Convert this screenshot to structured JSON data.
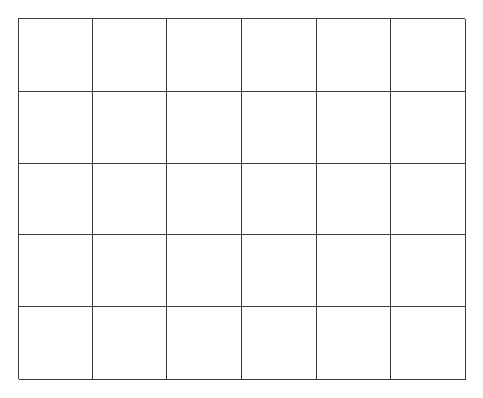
{
  "grid": {
    "columns": 6,
    "rows": 5,
    "line_color": "#3a3a3a",
    "background": "#ffffff",
    "cells": [
      [
        "",
        "",
        "",
        "",
        "",
        ""
      ],
      [
        "",
        "",
        "",
        "",
        "",
        ""
      ],
      [
        "",
        "",
        "",
        "",
        "",
        ""
      ],
      [
        "",
        "",
        "",
        "",
        "",
        ""
      ],
      [
        "",
        "",
        "",
        "",
        "",
        ""
      ]
    ]
  }
}
